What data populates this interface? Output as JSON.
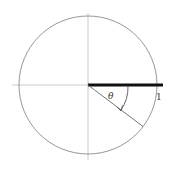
{
  "diagram": {
    "type": "unit-circle-angle",
    "labels": {
      "theta": "θ",
      "radius": "1"
    },
    "geometry": {
      "center": [
        88,
        85
      ],
      "radius": 69,
      "angle_deg": 37,
      "angle_direction": "clockwise"
    },
    "colors": {
      "circle": "#8a8a8a",
      "axes": "#bdbdbd",
      "thick_segment": "#111111",
      "radius_line": "#666666",
      "arc_arrow": "#555555",
      "text": "#333333"
    }
  }
}
